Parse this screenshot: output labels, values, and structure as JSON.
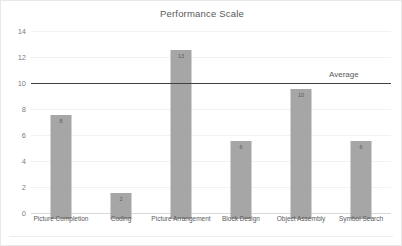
{
  "chart_data": {
    "type": "bar",
    "title": "Performance Scale",
    "xlabel": "",
    "ylabel": "",
    "categories": [
      "Picture Completion",
      "Coding",
      "Picture Arrangement",
      "Block Design",
      "Object Assembly",
      "Symbol Search"
    ],
    "values": [
      8,
      2,
      13,
      6,
      10,
      6
    ],
    "data_labels": [
      "8",
      "2",
      "13",
      "6",
      "10",
      "6"
    ],
    "ylim": [
      0,
      14
    ],
    "ytick_labels": [
      "0",
      "2",
      "4",
      "6",
      "8",
      "10",
      "12",
      "14"
    ],
    "ytick_values": [
      0,
      2,
      4,
      6,
      8,
      10,
      12,
      14
    ],
    "grid": true,
    "legend": "none",
    "bar_color": "#a6a6a6",
    "annotations": [
      {
        "name": "average-line",
        "label": "Average",
        "value": 10,
        "orientation": "horizontal",
        "color": "#404040"
      }
    ]
  }
}
